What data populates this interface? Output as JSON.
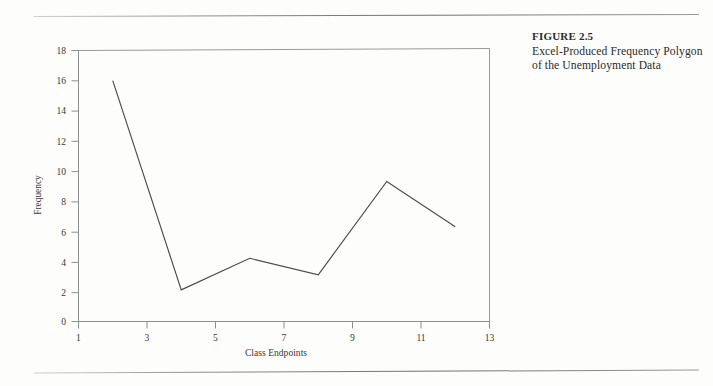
{
  "page": {
    "background_color": "#fdfdfc",
    "rule_color": "#7c7c7c"
  },
  "caption": {
    "figure_label": "FIGURE 2.5",
    "description": "Excel-Produced Frequency Polygon of the Unemployment Data"
  },
  "chart_data": {
    "type": "line",
    "title": "",
    "xlabel": "Class Endpoints",
    "ylabel": "Frequency",
    "x": [
      2,
      4,
      6,
      8,
      10,
      12
    ],
    "values": [
      16,
      2.1,
      4.2,
      3.1,
      9.3,
      6.3
    ],
    "series": [
      {
        "name": "Frequency",
        "values": [
          16,
          2.1,
          4.2,
          3.1,
          9.3,
          6.3
        ]
      }
    ],
    "xlim": [
      1,
      13
    ],
    "ylim": [
      0,
      18
    ],
    "xticks": [
      1,
      3,
      5,
      7,
      9,
      11,
      13
    ],
    "yticks": [
      0,
      2,
      4,
      6,
      8,
      10,
      12,
      14,
      16,
      18
    ],
    "xtick_labels": [
      "1",
      "3",
      "5",
      "7",
      "9",
      "11",
      "13"
    ],
    "ytick_labels": [
      "0",
      "2",
      "4",
      "6",
      "8",
      "10",
      "12",
      "14",
      "16",
      "18"
    ],
    "grid": false,
    "legend": false,
    "legend_position": "none",
    "line_color": "#4a4a4a",
    "frame": true
  }
}
